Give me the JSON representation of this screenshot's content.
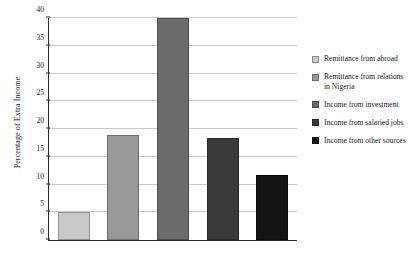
{
  "chart_data": {
    "type": "bar",
    "title": "",
    "xlabel": "",
    "ylabel": "Percentage of Extra Income",
    "ylim": [
      0,
      40
    ],
    "ytick_values": [
      0,
      5,
      10,
      15,
      20,
      25,
      30,
      35,
      40
    ],
    "ytick_labels": [
      "0",
      "5",
      "10",
      "15",
      "20",
      "25",
      "30",
      "35",
      "40"
    ],
    "grid": true,
    "legend_position": "right",
    "categories": [
      "Remittance from abroad",
      "Remittance from relations in Nigeria",
      "Income from investment",
      "Income from salaried jobs",
      "Income from other sources"
    ],
    "values": [
      5.0,
      19.0,
      40.0,
      18.3,
      11.8
    ],
    "colors": [
      "#c9c9c9",
      "#999999",
      "#6b6b6b",
      "#3a3a3a",
      "#141414"
    ],
    "series": [
      {
        "name": "Percentage of Extra Income",
        "values": [
          5.0,
          19.0,
          40.0,
          18.3,
          11.8
        ]
      }
    ]
  },
  "legend": {
    "items": [
      {
        "label": "Remittance from abroad",
        "color": "#c9c9c9"
      },
      {
        "label": "Remittance from relations in Nigeria",
        "color": "#999999"
      },
      {
        "label": "Income from investment",
        "color": "#6b6b6b"
      },
      {
        "label": "Income from salaried jobs",
        "color": "#3a3a3a"
      },
      {
        "label": "Income from other sources",
        "color": "#141414"
      }
    ]
  },
  "axis": {
    "y_title": "Percentage of Extra Income"
  }
}
